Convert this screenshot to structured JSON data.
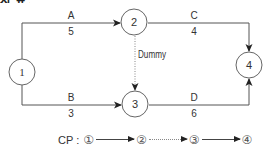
{
  "header_fragment": "사 료 사",
  "colors": {
    "line": "#444444",
    "node_stroke": "#666666",
    "text": "#333333",
    "dummy": "#888888"
  },
  "nodes": [
    {
      "id": "1",
      "label": "1",
      "cx": 22,
      "cy": 72
    },
    {
      "id": "2",
      "label": "2",
      "cx": 134,
      "cy": 22
    },
    {
      "id": "3",
      "label": "3",
      "cx": 135,
      "cy": 104
    },
    {
      "id": "4",
      "label": "4",
      "cx": 249,
      "cy": 65
    }
  ],
  "activities": [
    {
      "name": "A",
      "duration": "5",
      "from": "1",
      "to": "2"
    },
    {
      "name": "B",
      "duration": "3",
      "from": "1",
      "to": "3"
    },
    {
      "name": "C",
      "duration": "4",
      "from": "2",
      "to": "4"
    },
    {
      "name": "D",
      "duration": "6",
      "from": "3",
      "to": "4"
    }
  ],
  "dummy": {
    "label": "Dummy",
    "from": "2",
    "to": "3"
  },
  "critical_path": {
    "label": "CP :",
    "nodes": [
      "①",
      "②",
      "③",
      "④"
    ],
    "links": [
      "solid",
      "dotted",
      "solid"
    ]
  }
}
